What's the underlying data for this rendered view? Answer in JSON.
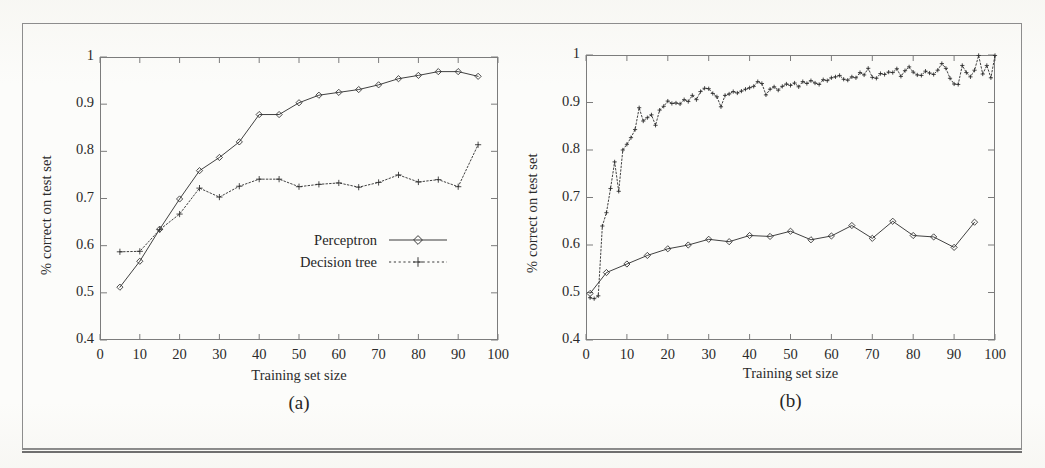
{
  "figure": {
    "axis_label_y": "% correct on test set",
    "axis_label_x": "Training set size",
    "series_names": {
      "perceptron": "Perceptron",
      "decision_tree": "Decision tree"
    },
    "caption_a": "(a)",
    "caption_b": "(b)",
    "ink_color": "#2b2b2b",
    "frame_color": "#7c7c7c",
    "page_color": "#fcfcfa"
  },
  "chart_data": [
    {
      "type": "line",
      "panel": "a",
      "title": "(a)",
      "xlabel": "Training set size",
      "ylabel": "% correct on test set",
      "xlim": [
        0,
        100
      ],
      "ylim": [
        0.4,
        1
      ],
      "xticks": [
        0,
        10,
        20,
        30,
        40,
        50,
        60,
        70,
        80,
        90,
        100
      ],
      "yticks": [
        0.4,
        0.5,
        0.6,
        0.7,
        0.8,
        0.9,
        1
      ],
      "xtick_labels": [
        "0",
        "10",
        "20",
        "30",
        "40",
        "50",
        "60",
        "70",
        "80",
        "90",
        "100"
      ],
      "ytick_labels": [
        "0.4",
        "0.5",
        "0.6",
        "0.7",
        "0.8",
        "0.9",
        "1"
      ],
      "grid": false,
      "legend_position": "inside-lower-right",
      "series": [
        {
          "name": "Perceptron",
          "marker": "diamond",
          "linestyle": "solid",
          "x": [
            5,
            10,
            15,
            20,
            25,
            30,
            35,
            40,
            45,
            50,
            55,
            60,
            65,
            70,
            75,
            80,
            85,
            90,
            95
          ],
          "y": [
            0.512,
            0.567,
            0.635,
            0.699,
            0.759,
            0.787,
            0.82,
            0.878,
            0.878,
            0.903,
            0.919,
            0.925,
            0.931,
            0.941,
            0.954,
            0.961,
            0.969,
            0.969,
            0.959
          ]
        },
        {
          "name": "Decision tree",
          "marker": "plus",
          "linestyle": "dotted",
          "x": [
            5,
            10,
            15,
            20,
            25,
            30,
            35,
            40,
            45,
            50,
            55,
            60,
            65,
            70,
            75,
            80,
            85,
            90,
            95
          ],
          "y": [
            0.587,
            0.588,
            0.634,
            0.667,
            0.722,
            0.703,
            0.726,
            0.741,
            0.741,
            0.725,
            0.73,
            0.733,
            0.724,
            0.734,
            0.75,
            0.735,
            0.74,
            0.725,
            0.814
          ]
        }
      ]
    },
    {
      "type": "line",
      "panel": "b",
      "title": "(b)",
      "xlabel": "Training set size",
      "ylabel": "% correct on test set",
      "xlim": [
        0,
        100
      ],
      "ylim": [
        0.4,
        1
      ],
      "xticks": [
        0,
        10,
        20,
        30,
        40,
        50,
        60,
        70,
        80,
        90,
        100
      ],
      "yticks": [
        0.4,
        0.5,
        0.6,
        0.7,
        0.8,
        0.9,
        1
      ],
      "xtick_labels": [
        "0",
        "10",
        "20",
        "30",
        "40",
        "50",
        "60",
        "70",
        "80",
        "90",
        "100"
      ],
      "ytick_labels": [
        "0.4",
        "0.5",
        "0.6",
        "0.7",
        "0.8",
        "0.9",
        "1"
      ],
      "grid": false,
      "legend_position": "inside-upper-right",
      "series": [
        {
          "name": "Perceptron",
          "marker": "diamond",
          "linestyle": "solid",
          "x": [
            1,
            5,
            10,
            15,
            20,
            25,
            30,
            35,
            40,
            45,
            50,
            55,
            60,
            65,
            70,
            75,
            80,
            85,
            90,
            95
          ],
          "y": [
            0.498,
            0.542,
            0.56,
            0.578,
            0.592,
            0.6,
            0.612,
            0.607,
            0.62,
            0.618,
            0.629,
            0.611,
            0.619,
            0.641,
            0.614,
            0.65,
            0.62,
            0.617,
            0.595,
            0.648
          ]
        },
        {
          "name": "Decision tree",
          "marker": "plus",
          "linestyle": "dotted",
          "x": [
            1,
            2,
            3,
            4,
            5,
            6,
            7,
            8,
            9,
            10,
            11,
            12,
            13,
            14,
            15,
            16,
            17,
            18,
            19,
            20,
            21,
            22,
            23,
            24,
            25,
            26,
            27,
            28,
            29,
            30,
            31,
            32,
            33,
            34,
            35,
            36,
            37,
            38,
            39,
            40,
            41,
            42,
            43,
            44,
            45,
            46,
            47,
            48,
            49,
            50,
            51,
            52,
            53,
            54,
            55,
            56,
            57,
            58,
            59,
            60,
            61,
            62,
            63,
            64,
            65,
            66,
            67,
            68,
            69,
            70,
            71,
            72,
            73,
            74,
            75,
            76,
            77,
            78,
            79,
            80,
            81,
            82,
            83,
            84,
            85,
            86,
            87,
            88,
            89,
            90,
            91,
            92,
            93,
            94,
            95,
            96,
            97,
            98,
            99,
            100
          ],
          "y": [
            0.489,
            0.487,
            0.493,
            0.64,
            0.668,
            0.719,
            0.775,
            0.713,
            0.8,
            0.812,
            0.826,
            0.843,
            0.889,
            0.861,
            0.868,
            0.874,
            0.852,
            0.884,
            0.892,
            0.903,
            0.898,
            0.899,
            0.897,
            0.906,
            0.902,
            0.915,
            0.906,
            0.923,
            0.93,
            0.929,
            0.919,
            0.912,
            0.891,
            0.915,
            0.918,
            0.923,
            0.92,
            0.924,
            0.928,
            0.931,
            0.934,
            0.944,
            0.94,
            0.916,
            0.928,
            0.933,
            0.926,
            0.934,
            0.939,
            0.936,
            0.941,
            0.933,
            0.944,
            0.94,
            0.946,
            0.941,
            0.938,
            0.948,
            0.946,
            0.952,
            0.954,
            0.957,
            0.949,
            0.947,
            0.954,
            0.952,
            0.963,
            0.958,
            0.972,
            0.953,
            0.951,
            0.961,
            0.959,
            0.964,
            0.963,
            0.971,
            0.955,
            0.967,
            0.975,
            0.964,
            0.958,
            0.957,
            0.966,
            0.962,
            0.959,
            0.968,
            0.982,
            0.972,
            0.951,
            0.939,
            0.938,
            0.978,
            0.963,
            0.954,
            0.968,
            0.999,
            0.96,
            0.978,
            0.952,
            0.999
          ]
        }
      ]
    }
  ]
}
